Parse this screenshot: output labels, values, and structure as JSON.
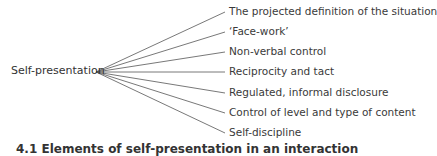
{
  "diagram": {
    "root": {
      "label": "Self-presentation"
    },
    "branches": [
      {
        "label": "The projected definition of the situation"
      },
      {
        "label": "‘Face-work’"
      },
      {
        "label": "Non-verbal control"
      },
      {
        "label": "Reciprocity and tact"
      },
      {
        "label": "Regulated, informal disclosure"
      },
      {
        "label": "Control of level and type of content"
      },
      {
        "label": "Self-discipline"
      }
    ],
    "caption": "4.1 Elements of self-presentation in an interaction"
  }
}
